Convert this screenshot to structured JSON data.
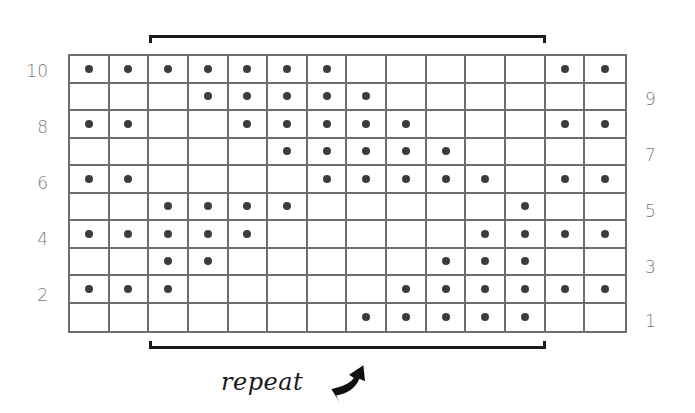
{
  "chart": {
    "rows": 10,
    "cols": 14,
    "left_row_labels": [
      "10",
      "8",
      "6",
      "4",
      "2"
    ],
    "right_row_labels": [
      "9",
      "7",
      "5",
      "3",
      "1"
    ],
    "repeat_label": "repeat",
    "repeat_columns": [
      3,
      12
    ],
    "colors": {
      "grid_line": "#6e6e6e",
      "dot": "#3c3c3c",
      "label": "#7a7a7a",
      "bracket": "#1a1a1a"
    },
    "legend_symbol": "dot",
    "pattern_rows_top_to_bottom": [
      {
        "row": 10,
        "cells": [
          1,
          1,
          1,
          1,
          1,
          1,
          1,
          0,
          0,
          0,
          0,
          0,
          1,
          1
        ]
      },
      {
        "row": 9,
        "cells": [
          0,
          0,
          0,
          1,
          1,
          1,
          1,
          1,
          0,
          0,
          0,
          0,
          0,
          0
        ]
      },
      {
        "row": 8,
        "cells": [
          1,
          1,
          0,
          0,
          1,
          1,
          1,
          1,
          1,
          0,
          0,
          0,
          1,
          1
        ]
      },
      {
        "row": 7,
        "cells": [
          0,
          0,
          0,
          0,
          0,
          1,
          1,
          1,
          1,
          1,
          0,
          0,
          0,
          0
        ]
      },
      {
        "row": 6,
        "cells": [
          1,
          1,
          0,
          0,
          0,
          0,
          1,
          1,
          1,
          1,
          1,
          0,
          1,
          1
        ]
      },
      {
        "row": 5,
        "cells": [
          0,
          0,
          1,
          1,
          1,
          1,
          0,
          0,
          0,
          0,
          0,
          1,
          0,
          0
        ]
      },
      {
        "row": 4,
        "cells": [
          1,
          1,
          1,
          1,
          1,
          0,
          0,
          0,
          0,
          0,
          1,
          1,
          1,
          1
        ]
      },
      {
        "row": 3,
        "cells": [
          0,
          0,
          1,
          1,
          0,
          0,
          0,
          0,
          0,
          1,
          1,
          1,
          0,
          0
        ]
      },
      {
        "row": 2,
        "cells": [
          1,
          1,
          1,
          0,
          0,
          0,
          0,
          0,
          1,
          1,
          1,
          1,
          1,
          1
        ]
      },
      {
        "row": 1,
        "cells": [
          0,
          0,
          0,
          0,
          0,
          0,
          0,
          1,
          1,
          1,
          1,
          1,
          0,
          0
        ]
      }
    ]
  }
}
